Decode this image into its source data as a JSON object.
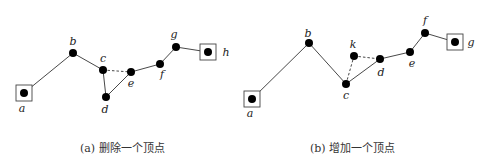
{
  "panels": [
    {
      "id": "a",
      "caption": "(a) 删除一个顶点",
      "nodes": [
        {
          "id": "a",
          "label": "a",
          "x": 24,
          "y": 93,
          "boxed": true,
          "lx": 22,
          "ly": 112
        },
        {
          "id": "b",
          "label": "b",
          "x": 73,
          "y": 53,
          "boxed": false,
          "lx": 73,
          "ly": 45
        },
        {
          "id": "c",
          "label": "c",
          "x": 103,
          "y": 70,
          "boxed": false,
          "lx": 103,
          "ly": 62
        },
        {
          "id": "d",
          "label": "d",
          "x": 106,
          "y": 97,
          "boxed": false,
          "lx": 105,
          "ly": 113
        },
        {
          "id": "e",
          "label": "e",
          "x": 131,
          "y": 72,
          "boxed": false,
          "lx": 131,
          "ly": 87
        },
        {
          "id": "f",
          "label": "f",
          "x": 160,
          "y": 64,
          "boxed": false,
          "lx": 162,
          "ly": 78
        },
        {
          "id": "g",
          "label": "g",
          "x": 176,
          "y": 47,
          "boxed": false,
          "lx": 174,
          "ly": 38
        },
        {
          "id": "h",
          "label": "h",
          "x": 208,
          "y": 52,
          "boxed": true,
          "lx": 226,
          "ly": 56
        }
      ],
      "edges": [
        {
          "from": "a",
          "to": "b",
          "style": "solid"
        },
        {
          "from": "b",
          "to": "c",
          "style": "solid"
        },
        {
          "from": "c",
          "to": "d",
          "style": "solid"
        },
        {
          "from": "d",
          "to": "e",
          "style": "solid"
        },
        {
          "from": "c",
          "to": "e",
          "style": "dashed"
        },
        {
          "from": "e",
          "to": "f",
          "style": "solid"
        },
        {
          "from": "f",
          "to": "g",
          "style": "solid"
        },
        {
          "from": "g",
          "to": "h",
          "style": "solid"
        }
      ]
    },
    {
      "id": "b",
      "caption": "(b) 增加一个顶点",
      "nodes": [
        {
          "id": "a",
          "label": "a",
          "x": 252,
          "y": 99,
          "boxed": true,
          "lx": 250,
          "ly": 117
        },
        {
          "id": "b",
          "label": "b",
          "x": 309,
          "y": 43,
          "boxed": false,
          "lx": 308,
          "ly": 37
        },
        {
          "id": "c",
          "label": "c",
          "x": 346,
          "y": 84,
          "boxed": false,
          "lx": 346,
          "ly": 99
        },
        {
          "id": "k",
          "label": "k",
          "x": 354,
          "y": 56,
          "boxed": false,
          "lx": 353,
          "ly": 48
        },
        {
          "id": "d",
          "label": "d",
          "x": 380,
          "y": 59,
          "boxed": false,
          "lx": 381,
          "ly": 76
        },
        {
          "id": "e",
          "label": "e",
          "x": 410,
          "y": 52,
          "boxed": false,
          "lx": 412,
          "ly": 67
        },
        {
          "id": "f",
          "label": "f",
          "x": 425,
          "y": 33,
          "boxed": false,
          "lx": 425,
          "ly": 24
        },
        {
          "id": "g",
          "label": "g",
          "x": 455,
          "y": 42,
          "boxed": true,
          "lx": 471,
          "ly": 46
        }
      ],
      "edges": [
        {
          "from": "a",
          "to": "b",
          "style": "solid"
        },
        {
          "from": "b",
          "to": "c",
          "style": "solid"
        },
        {
          "from": "c",
          "to": "d",
          "style": "solid"
        },
        {
          "from": "c",
          "to": "k",
          "style": "dashed"
        },
        {
          "from": "k",
          "to": "d",
          "style": "dashed"
        },
        {
          "from": "d",
          "to": "e",
          "style": "solid"
        },
        {
          "from": "e",
          "to": "f",
          "style": "solid"
        },
        {
          "from": "f",
          "to": "g",
          "style": "solid"
        }
      ]
    }
  ],
  "captions": {
    "left": "(a) 删除一个顶点",
    "right": "(b) 增加一个顶点"
  },
  "style": {
    "node_color": "#000000",
    "edge_color": "#333333",
    "box_color": "#444444"
  }
}
